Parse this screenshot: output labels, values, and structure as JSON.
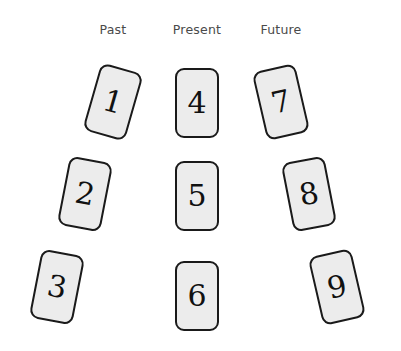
{
  "spread": {
    "title": "Past Present Future three-column card spread",
    "background_color": "#ffffff",
    "card_fill_color": "#ececec",
    "card_border_color": "#1a1a1a",
    "label_color": "#4a4a4a",
    "number_color": "#111111"
  },
  "columns": [
    {
      "label": "Past",
      "x": 113
    },
    {
      "label": "Present",
      "x": 197
    },
    {
      "label": "Future",
      "x": 281
    }
  ],
  "cards": [
    {
      "number": "1",
      "column": "Past",
      "x": 113,
      "y": 102,
      "rotation": 16
    },
    {
      "number": "2",
      "column": "Past",
      "x": 85,
      "y": 194,
      "rotation": 11
    },
    {
      "number": "3",
      "column": "Past",
      "x": 57,
      "y": 287,
      "rotation": 11
    },
    {
      "number": "4",
      "column": "Present",
      "x": 197,
      "y": 103,
      "rotation": 0
    },
    {
      "number": "5",
      "column": "Present",
      "x": 197,
      "y": 196,
      "rotation": 0
    },
    {
      "number": "6",
      "column": "Present",
      "x": 197,
      "y": 296,
      "rotation": 0
    },
    {
      "number": "7",
      "column": "Future",
      "x": 281,
      "y": 102,
      "rotation": -13
    },
    {
      "number": "8",
      "column": "Future",
      "x": 309,
      "y": 194,
      "rotation": -11
    },
    {
      "number": "9",
      "column": "Future",
      "x": 337,
      "y": 287,
      "rotation": -13
    }
  ]
}
